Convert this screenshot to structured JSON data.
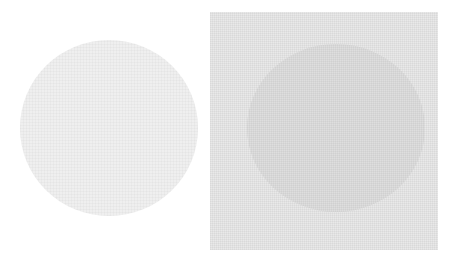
{
  "figure": {
    "left_panel": {
      "shape": "circle",
      "fill": "#efefef",
      "background": "#ffffff"
    },
    "right_panel": {
      "shape": "square-with-circle",
      "square_fill": "#e9e9e9",
      "circle_fill": "#dedede"
    }
  }
}
